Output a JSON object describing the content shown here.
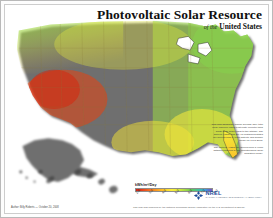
{
  "poster": {
    "title": "Photovoltaic Solar Resource",
    "subtitle_of": "of the",
    "subtitle": "United States"
  },
  "legend": {
    "title": "kWh/m²/Day",
    "ticks": [
      "2.0",
      "3.0",
      "4.0",
      "5.0",
      "6.0",
      "7.0",
      "8.0"
    ],
    "colors": [
      "#d01f12",
      "#e8441d",
      "#f4701f",
      "#f99a22",
      "#fdc828",
      "#fbee3a",
      "#d6e93c",
      "#9bd845",
      "#5ec85c",
      "#3fc0a0",
      "#3aa8d8",
      "#5b6fd0",
      "#7b4fc0"
    ]
  },
  "logo": {
    "name": "NREL",
    "tagline": "NATIONAL RENEWABLE ENERGY LABORATORY"
  },
  "notes": {
    "paragraph_1": "This map shows the annual average daily total solar resource using a flat plate collector tilted south at an angle equal to the latitude. The data for Hawaii and the 48 contiguous states are derived from a 40km satellite and surface model for 1998-2005.",
    "paragraph_2": "The data for Alaska are derived from a 40km dataset produced by the Climatological Solar Radiation Model."
  },
  "credits": {
    "left": "Author: Billy Roberts — October 20, 2008",
    "footer": "This map was produced by the National Renewable Energy Laboratory for the U.S. Department of Energy."
  },
  "chart_data": {
    "type": "heatmap",
    "title": "Photovoltaic Solar Resource of the United States",
    "ylabel": "kWh/m²/Day",
    "zlim": [
      2.0,
      8.0
    ],
    "regions": [
      {
        "name": "Desert Southwest (AZ, NV, Southern CA, NM)",
        "value": 7.5,
        "color": "#d01f12"
      },
      {
        "name": "Southern Rockies / West Texas",
        "value": 6.5,
        "color": "#f4701f"
      },
      {
        "name": "Great Plains",
        "value": 5.2,
        "color": "#fdc828"
      },
      {
        "name": "Southeast / Gulf Coast",
        "value": 5.0,
        "color": "#e8e93c"
      },
      {
        "name": "Midwest",
        "value": 4.4,
        "color": "#c6e63e"
      },
      {
        "name": "Northeast",
        "value": 4.0,
        "color": "#9bd845"
      },
      {
        "name": "Pacific Northwest",
        "value": 3.6,
        "color": "#72cc50"
      },
      {
        "name": "Hawaii",
        "value": 6.0,
        "color": "#f9a825"
      },
      {
        "name": "Alaska",
        "value": 3.0,
        "color": "#5ec88c"
      }
    ]
  }
}
